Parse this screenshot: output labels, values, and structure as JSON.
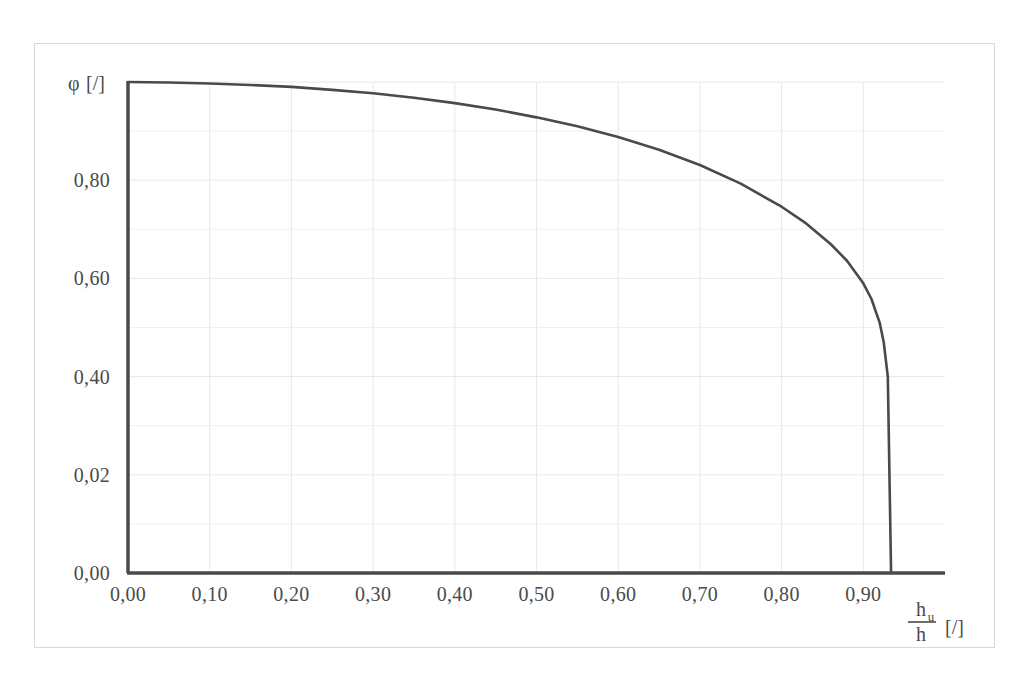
{
  "chart_data": {
    "type": "line",
    "title": "",
    "subtitle": "",
    "xlabel_numerator": "h",
    "xlabel_numerator_sub": "u",
    "xlabel_denominator": "h",
    "xlabel_units": "[/]",
    "ylabel_symbol": "φ",
    "ylabel_units": "[/]",
    "xlim": [
      0.0,
      1.0
    ],
    "ylim": [
      0.0,
      1.0
    ],
    "grid": true,
    "legend": "none",
    "x_tick_labels": [
      "0,00",
      "0,10",
      "0,20",
      "0,30",
      "0,40",
      "0,50",
      "0,60",
      "0,70",
      "0,80",
      "0,90"
    ],
    "x_tick_values": [
      0.0,
      0.1,
      0.2,
      0.3,
      0.4,
      0.5,
      0.6,
      0.7,
      0.8,
      0.9
    ],
    "y_tick_labels": [
      "0,00",
      "0,02",
      "0,40",
      "0,60",
      "0,80",
      "φ [/]"
    ],
    "y_tick_values": [
      0.0,
      0.2,
      0.4,
      0.6,
      0.8,
      1.0
    ],
    "series": [
      {
        "name": "phi",
        "x": [
          0.0,
          0.05,
          0.1,
          0.15,
          0.2,
          0.25,
          0.3,
          0.35,
          0.4,
          0.45,
          0.5,
          0.55,
          0.6,
          0.65,
          0.7,
          0.75,
          0.8,
          0.83,
          0.86,
          0.88,
          0.9,
          0.91,
          0.92,
          0.925,
          0.93,
          0.934
        ],
        "values": [
          1.0,
          0.999,
          0.997,
          0.994,
          0.99,
          0.984,
          0.977,
          0.968,
          0.957,
          0.944,
          0.928,
          0.91,
          0.888,
          0.862,
          0.831,
          0.793,
          0.746,
          0.712,
          0.67,
          0.636,
          0.59,
          0.558,
          0.51,
          0.47,
          0.4,
          0.0
        ]
      }
    ]
  },
  "figure": {
    "background_color": "#ffffff",
    "curve_color": "#4a4a4a",
    "axis_color": "#4a4a4a",
    "grid_color": "#e8e8e8",
    "frame_color": "#d8d8d8"
  }
}
